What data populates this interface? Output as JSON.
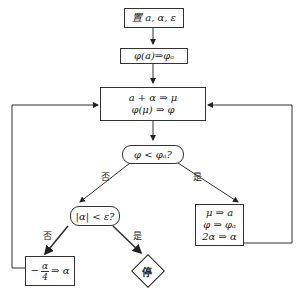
{
  "flowchart": {
    "start": "置 a, α, ε",
    "init": "φ(a)⇒φₐ",
    "update": [
      "a + α ⇒ μ",
      "φ(μ) ⇒ φ"
    ],
    "decision1": "φ < φₐ?",
    "decision1_no": "否",
    "decision1_yes": "是",
    "decision2": "|α| < ε?",
    "decision2_no": "否",
    "decision2_yes": "是",
    "accept": [
      "μ ⇒ a",
      "φ ⇒ φₐ",
      "2α ⇒ α"
    ],
    "shrink": "−α/4 ⇒ α",
    "shrink_num": "α",
    "shrink_den": "4",
    "stop": "停"
  }
}
